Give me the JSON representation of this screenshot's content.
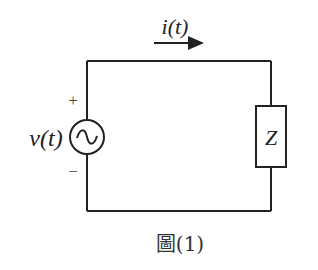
{
  "diagram": {
    "type": "circuit",
    "source": {
      "label": "v(t)",
      "kind": "ac-voltage-source",
      "polarity": {
        "plus": "+",
        "minus": "−"
      }
    },
    "current": {
      "label": "i(t)",
      "direction": "right"
    },
    "load": {
      "label": "Z",
      "kind": "impedance"
    },
    "caption": "圖(1)",
    "colors": {
      "stroke": "#222222",
      "background": "#ffffff"
    }
  }
}
